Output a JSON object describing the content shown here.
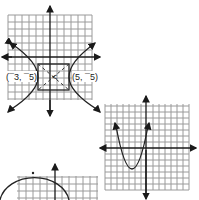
{
  "figure": {
    "graphs": [
      {
        "id": "hyperbola",
        "type": "hyperbola (horizontal transverse axis)",
        "labels": {
          "left_vertex": "(¯3, ¯5)",
          "right_vertex": "(5, ¯5)",
          "center_mark": "<"
        },
        "has_asymptote_box": true,
        "has_dashed_asymptotes": true
      },
      {
        "id": "parabola",
        "type": "parabola opening upward",
        "vertex_position": "left of y-axis, below x-axis"
      },
      {
        "id": "semicircle",
        "type": "upper semicircle (partially visible)",
        "center_position": "left of y-axis"
      }
    ]
  },
  "colors": {
    "grid": "#9a9a9a",
    "ink": "#1a1a1a",
    "background": "#ffffff"
  }
}
